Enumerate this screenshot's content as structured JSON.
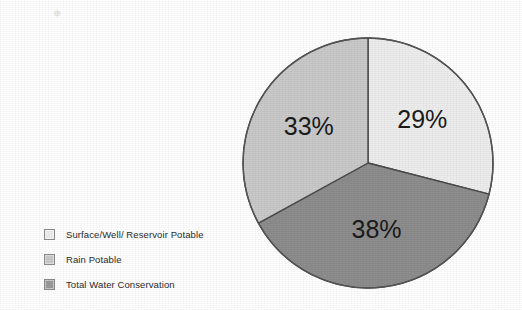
{
  "chart_data": {
    "type": "pie",
    "title": "",
    "labels": [
      "Surface/Well/ Reservoir Potable",
      "Rain Potable",
      "Total Water Conservation"
    ],
    "values": [
      29,
      38,
      33
    ],
    "value_labels": [
      "29%",
      "38%",
      "33%"
    ],
    "unit": "%",
    "start_angle_deg": 0,
    "direction": "clockwise",
    "legend_position": "left",
    "grid": false,
    "colors": [
      "#ededed",
      "#8d8d8d",
      "#c9c9c9"
    ],
    "slice_outline_color": "#4a4a4a",
    "slices": [
      {
        "label": "Surface/Well/ Reservoir Potable",
        "value": 29,
        "value_label": "29%",
        "color": "#ededed",
        "position": "upper-right"
      },
      {
        "label": "Rain Potable",
        "value": 38,
        "value_label": "38%",
        "color": "#8d8d8d",
        "position": "bottom"
      },
      {
        "label": "Total Water Conservation",
        "value": 33,
        "value_label": "33%",
        "color": "#c9c9c9",
        "position": "left"
      }
    ]
  },
  "legend": {
    "items": [
      {
        "label": "Surface/Well/ Reservoir Potable",
        "color": "#ededed"
      },
      {
        "label": "Rain Potable",
        "color": "#c9c9c9"
      },
      {
        "label": "Total Water Conservation",
        "color": "#9a9a9a"
      }
    ]
  },
  "artifacts": {
    "speck": "✵"
  }
}
